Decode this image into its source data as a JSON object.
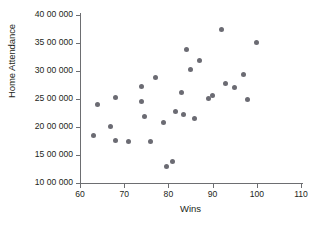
{
  "chart_data": {
    "type": "scatter",
    "title": "",
    "xlabel": "Wins",
    "ylabel": "Home Attendance",
    "xlim": [
      60,
      110
    ],
    "ylim": [
      1000000,
      4000000
    ],
    "xticks": [
      60,
      70,
      80,
      90,
      100,
      110
    ],
    "xtick_labels": [
      "60",
      "70",
      "80",
      "90",
      "100",
      "110"
    ],
    "yticks": [
      1000000,
      1500000,
      2000000,
      2500000,
      3000000,
      3500000,
      4000000
    ],
    "ytick_labels": [
      "10 00 000",
      "15 00 000",
      "20 00 000",
      "25 00 000",
      "30 00 000",
      "35 00 000",
      "40 00 000"
    ],
    "grid": false,
    "legend": null,
    "marker_color": "#6b6b73",
    "axis_color": "#6d6e71",
    "points": [
      {
        "x": 63.0,
        "y": 1840000
      },
      {
        "x": 64.0,
        "y": 2410000
      },
      {
        "x": 67.0,
        "y": 2005000
      },
      {
        "x": 68.0,
        "y": 2525000
      },
      {
        "x": 68.0,
        "y": 1765000
      },
      {
        "x": 71.0,
        "y": 1740000
      },
      {
        "x": 74.0,
        "y": 2715000
      },
      {
        "x": 74.0,
        "y": 2460000
      },
      {
        "x": 74.5,
        "y": 2190000
      },
      {
        "x": 76.0,
        "y": 1740000
      },
      {
        "x": 77.0,
        "y": 2880000
      },
      {
        "x": 79.0,
        "y": 2075000
      },
      {
        "x": 79.5,
        "y": 1295000
      },
      {
        "x": 81.0,
        "y": 1390000
      },
      {
        "x": 81.5,
        "y": 2285000
      },
      {
        "x": 83.0,
        "y": 2620000
      },
      {
        "x": 83.5,
        "y": 2220000
      },
      {
        "x": 84.0,
        "y": 3385000
      },
      {
        "x": 85.0,
        "y": 3025000
      },
      {
        "x": 86.0,
        "y": 2150000
      },
      {
        "x": 87.0,
        "y": 3190000
      },
      {
        "x": 89.0,
        "y": 2505000
      },
      {
        "x": 90.0,
        "y": 2570000
      },
      {
        "x": 92.0,
        "y": 3750000
      },
      {
        "x": 93.0,
        "y": 2785000
      },
      {
        "x": 95.0,
        "y": 2710000
      },
      {
        "x": 97.0,
        "y": 2935000
      },
      {
        "x": 98.0,
        "y": 2500000
      },
      {
        "x": 100.0,
        "y": 3515000
      }
    ]
  }
}
